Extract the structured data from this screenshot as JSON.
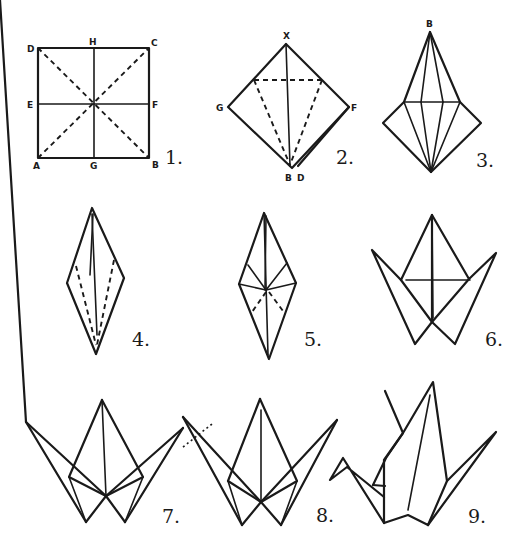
{
  "diagram": {
    "steps": [
      {
        "number": "1.",
        "labels": [
          "D",
          "H",
          "C",
          "E",
          "F",
          "A",
          "G",
          "B"
        ]
      },
      {
        "number": "2.",
        "labels": [
          "X",
          "G",
          "F",
          "B",
          "D"
        ]
      },
      {
        "number": "3.",
        "labels": [
          "B"
        ]
      },
      {
        "number": "4.",
        "labels": []
      },
      {
        "number": "5.",
        "labels": []
      },
      {
        "number": "6.",
        "labels": []
      },
      {
        "number": "7.",
        "labels": []
      },
      {
        "number": "8.",
        "labels": []
      },
      {
        "number": "9.",
        "labels": []
      }
    ],
    "colors": {
      "ink": "#1a1a1a",
      "paper": "#ffffff"
    }
  }
}
